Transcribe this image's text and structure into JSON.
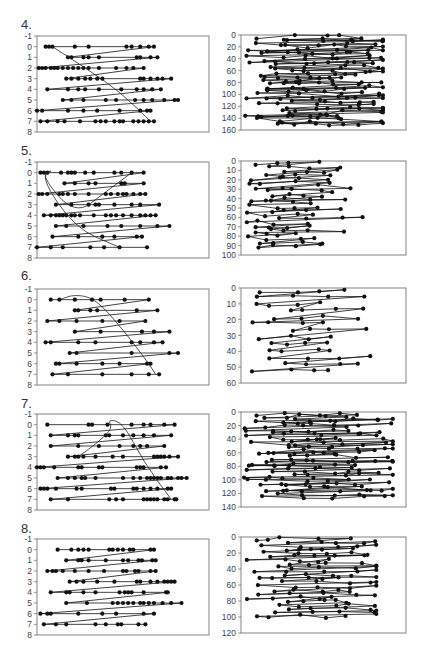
{
  "figure": {
    "width": 428,
    "height": 654,
    "row_labels": [
      "4.",
      "5.",
      "6.",
      "7.",
      "8."
    ]
  },
  "colors": {
    "marker": "#111111",
    "line": "#111111",
    "frame": "#777777",
    "tick_text": "#444444"
  },
  "chart_data": [
    {
      "id": "4-left",
      "row": "4.",
      "type": "line",
      "ylim": [
        -1,
        8
      ],
      "y_inverted": true,
      "yticks": [
        -1,
        0,
        1,
        2,
        3,
        4,
        5,
        6,
        7,
        8
      ],
      "xlabel": "",
      "ylabel": "",
      "grid": false,
      "rows": [
        {
          "y": 0,
          "x": [
            0.05,
            0.07,
            0.09,
            0.22,
            0.3,
            0.52,
            0.55,
            0.6,
            0.65,
            0.68
          ]
        },
        {
          "y": 1,
          "x": [
            0.18,
            0.2,
            0.27,
            0.3,
            0.36,
            0.58,
            0.6,
            0.66,
            0.7
          ]
        },
        {
          "y": 2,
          "x": [
            0.01,
            0.03,
            0.05,
            0.08,
            0.1,
            0.12,
            0.15,
            0.18,
            0.21,
            0.24,
            0.27,
            0.3,
            0.36,
            0.46,
            0.52,
            0.56,
            0.62
          ]
        },
        {
          "y": 3,
          "x": [
            0.17,
            0.2,
            0.24,
            0.28,
            0.31,
            0.35,
            0.38,
            0.6,
            0.62,
            0.66,
            0.7,
            0.73,
            0.78
          ]
        },
        {
          "y": 4,
          "x": [
            0.06,
            0.18,
            0.24,
            0.28,
            0.36,
            0.49,
            0.58,
            0.62,
            0.67,
            0.72
          ]
        },
        {
          "y": 5,
          "x": [
            0.15,
            0.2,
            0.27,
            0.4,
            0.46,
            0.57,
            0.62,
            0.67,
            0.74,
            0.8,
            0.82
          ]
        },
        {
          "y": 6,
          "x": [
            0.0,
            0.03,
            0.18,
            0.27,
            0.35,
            0.48,
            0.6,
            0.64,
            0.66
          ]
        },
        {
          "y": 7,
          "x": [
            0.02,
            0.06,
            0.12,
            0.16,
            0.25,
            0.34,
            0.37,
            0.4,
            0.45,
            0.48,
            0.5,
            0.56,
            0.59,
            0.62,
            0.65,
            0.68
          ]
        }
      ],
      "curve": [
        [
          0.09,
          0
        ],
        [
          0.3,
          2.2
        ],
        [
          0.48,
          4.2
        ],
        [
          0.66,
          7
        ]
      ]
    },
    {
      "id": "4-right",
      "row": "4.",
      "type": "line",
      "ylim": [
        0,
        160
      ],
      "y_inverted": true,
      "yticks": [
        0,
        20,
        40,
        60,
        80,
        100,
        120,
        140,
        160
      ],
      "xlabel": "",
      "ylabel": "",
      "grid": false,
      "points_per_row": 5,
      "n_rows": 36,
      "x_range": [
        0.02,
        0.86
      ],
      "y_range": [
        1,
        150
      ],
      "seed": 41
    },
    {
      "id": "5-left",
      "row": "5.",
      "type": "line",
      "ylim": [
        -1,
        8
      ],
      "y_inverted": true,
      "yticks": [
        -1,
        0,
        1,
        2,
        3,
        4,
        5,
        6,
        7,
        8
      ],
      "xlabel": "",
      "ylabel": "",
      "grid": false,
      "rows": [
        {
          "y": 0,
          "x": [
            0.02,
            0.04,
            0.06,
            0.14,
            0.18,
            0.2,
            0.22,
            0.28,
            0.33,
            0.45,
            0.49,
            0.55,
            0.62
          ]
        },
        {
          "y": 1,
          "x": [
            0.16,
            0.22,
            0.3,
            0.34,
            0.49,
            0.51,
            0.62
          ]
        },
        {
          "y": 2,
          "x": [
            0.01,
            0.03,
            0.06,
            0.13,
            0.15,
            0.18,
            0.22,
            0.3,
            0.4,
            0.43,
            0.47,
            0.5,
            0.52,
            0.56,
            0.6,
            0.63
          ]
        },
        {
          "y": 3,
          "x": [
            0.11,
            0.2,
            0.3,
            0.34,
            0.36,
            0.45,
            0.55,
            0.6,
            0.71
          ]
        },
        {
          "y": 4,
          "x": [
            0.04,
            0.08,
            0.11,
            0.13,
            0.15,
            0.17,
            0.2,
            0.22,
            0.25,
            0.33,
            0.4,
            0.43,
            0.46,
            0.5,
            0.55,
            0.6,
            0.63,
            0.66,
            0.69
          ]
        },
        {
          "y": 5,
          "x": [
            0.11,
            0.17,
            0.27,
            0.41,
            0.49,
            0.6,
            0.7,
            0.77
          ]
        },
        {
          "y": 6,
          "x": [
            0.09,
            0.24,
            0.38,
            0.45,
            0.58,
            0.61
          ]
        },
        {
          "y": 7,
          "x": [
            0.0,
            0.08,
            0.15,
            0.31,
            0.39,
            0.48,
            0.64
          ]
        }
      ],
      "curve": [
        [
          0.55,
          0
        ],
        [
          0.4,
          1.8
        ],
        [
          0.22,
          4
        ],
        [
          0.02,
          0.2
        ],
        [
          0.1,
          -0.3
        ],
        [
          0.02,
          0.4
        ],
        [
          0.22,
          5.2
        ],
        [
          0.48,
          7
        ]
      ]
    },
    {
      "id": "5-right",
      "row": "5.",
      "type": "line",
      "ylim": [
        0,
        100
      ],
      "y_inverted": true,
      "yticks": [
        0,
        10,
        20,
        30,
        40,
        50,
        60,
        70,
        80,
        90,
        100
      ],
      "xlabel": "",
      "ylabel": "",
      "grid": false,
      "points_per_row": 4,
      "n_rows": 22,
      "x_range": [
        0.02,
        0.78
      ],
      "y_range": [
        1,
        90
      ],
      "seed": 52
    },
    {
      "id": "6-left",
      "row": "6.",
      "type": "line",
      "ylim": [
        -1,
        8
      ],
      "y_inverted": true,
      "yticks": [
        -1,
        0,
        1,
        2,
        3,
        4,
        5,
        6,
        7,
        8
      ],
      "xlabel": "",
      "ylabel": "",
      "grid": false,
      "rows": [
        {
          "y": 0,
          "x": [
            0.08,
            0.13,
            0.22,
            0.32,
            0.37,
            0.51,
            0.65
          ]
        },
        {
          "y": 1,
          "x": [
            0.22,
            0.24,
            0.31,
            0.35,
            0.58,
            0.7
          ]
        },
        {
          "y": 2,
          "x": [
            0.06,
            0.13,
            0.23,
            0.38,
            0.48,
            0.63
          ]
        },
        {
          "y": 3,
          "x": [
            0.22,
            0.37,
            0.61,
            0.68,
            0.77
          ]
        },
        {
          "y": 4,
          "x": [
            0.05,
            0.08,
            0.24,
            0.34,
            0.55,
            0.6,
            0.68,
            0.73
          ]
        },
        {
          "y": 5,
          "x": [
            0.19,
            0.23,
            0.55,
            0.77,
            0.82
          ]
        },
        {
          "y": 6,
          "x": [
            0.11,
            0.13,
            0.23,
            0.38,
            0.48,
            0.64,
            0.66
          ]
        },
        {
          "y": 7,
          "x": [
            0.09,
            0.18,
            0.38,
            0.55,
            0.65,
            0.71
          ]
        }
      ],
      "curve": [
        [
          0.13,
          0
        ],
        [
          0.22,
          -0.5
        ],
        [
          0.34,
          -0.1
        ],
        [
          0.5,
          2.8
        ],
        [
          0.65,
          6
        ],
        [
          0.69,
          7
        ]
      ]
    },
    {
      "id": "6-right",
      "row": "6.",
      "type": "line",
      "ylim": [
        0,
        60
      ],
      "y_inverted": true,
      "yticks": [
        0,
        10,
        20,
        30,
        40,
        50,
        60
      ],
      "xlabel": "",
      "ylabel": "",
      "grid": false,
      "points_per_row": 4,
      "n_rows": 13,
      "x_range": [
        0.04,
        0.84
      ],
      "y_range": [
        1,
        52
      ],
      "seed": 63
    },
    {
      "id": "7-left",
      "row": "7.",
      "type": "line",
      "ylim": [
        -1,
        8
      ],
      "y_inverted": true,
      "yticks": [
        -1,
        0,
        1,
        2,
        3,
        4,
        5,
        6,
        7,
        8
      ],
      "xlabel": "",
      "ylabel": "",
      "grid": false,
      "rows": [
        {
          "y": 0,
          "x": [
            0.06,
            0.3,
            0.32,
            0.41,
            0.55,
            0.62,
            0.66,
            0.74,
            0.8
          ]
        },
        {
          "y": 1,
          "x": [
            0.08,
            0.18,
            0.22,
            0.24,
            0.4,
            0.42,
            0.5,
            0.56,
            0.62,
            0.68,
            0.78
          ]
        },
        {
          "y": 2,
          "x": [
            0.08,
            0.24,
            0.36,
            0.48,
            0.56,
            0.6,
            0.64,
            0.74
          ]
        },
        {
          "y": 3,
          "x": [
            0.18,
            0.22,
            0.24,
            0.27,
            0.34,
            0.44,
            0.5,
            0.68,
            0.7,
            0.72,
            0.74,
            0.77,
            0.82
          ]
        },
        {
          "y": 4,
          "x": [
            0.0,
            0.02,
            0.04,
            0.1,
            0.24,
            0.26,
            0.36,
            0.38,
            0.58,
            0.6,
            0.62,
            0.72,
            0.75
          ]
        },
        {
          "y": 5,
          "x": [
            0.12,
            0.18,
            0.22,
            0.26,
            0.28,
            0.34,
            0.5,
            0.56,
            0.6,
            0.64,
            0.66,
            0.68,
            0.7,
            0.72,
            0.76,
            0.78,
            0.82,
            0.84,
            0.87
          ]
        },
        {
          "y": 6,
          "x": [
            0.02,
            0.04,
            0.06,
            0.11,
            0.23,
            0.26,
            0.43,
            0.45,
            0.56,
            0.58,
            0.62,
            0.66,
            0.7,
            0.76,
            0.78
          ]
        },
        {
          "y": 7,
          "x": [
            0.08,
            0.18,
            0.42,
            0.46,
            0.5,
            0.62,
            0.64,
            0.66,
            0.68,
            0.7,
            0.74,
            0.76,
            0.8,
            0.81
          ]
        }
      ],
      "curve": [
        [
          0.24,
          3
        ],
        [
          0.36,
          1.6
        ],
        [
          0.44,
          0.3
        ],
        [
          0.41,
          -0.5
        ],
        [
          0.5,
          -0.2
        ],
        [
          0.62,
          3.5
        ],
        [
          0.78,
          7
        ]
      ]
    },
    {
      "id": "7-right",
      "row": "7.",
      "type": "line",
      "ylim": [
        0,
        140
      ],
      "y_inverted": true,
      "yticks": [
        0,
        20,
        40,
        60,
        80,
        100,
        120,
        140
      ],
      "xlabel": "",
      "ylabel": "",
      "grid": false,
      "points_per_row": 5,
      "n_rows": 32,
      "x_range": [
        0.01,
        0.92
      ],
      "y_range": [
        1,
        124
      ],
      "seed": 74
    },
    {
      "id": "8-left",
      "row": "8.",
      "type": "line",
      "ylim": [
        -1,
        8
      ],
      "y_inverted": true,
      "yticks": [
        -1,
        0,
        1,
        2,
        3,
        4,
        5,
        6,
        7,
        8
      ],
      "xlabel": "",
      "ylabel": "",
      "grid": false,
      "rows": [
        {
          "y": 0,
          "x": [
            0.12,
            0.2,
            0.24,
            0.27,
            0.3,
            0.42,
            0.44,
            0.47,
            0.5,
            0.54,
            0.56,
            0.66,
            0.68
          ]
        },
        {
          "y": 1,
          "x": [
            0.17,
            0.24,
            0.26,
            0.3,
            0.4,
            0.5,
            0.53,
            0.59,
            0.61,
            0.67,
            0.69
          ]
        },
        {
          "y": 2,
          "x": [
            0.06,
            0.09,
            0.11,
            0.15,
            0.22,
            0.3,
            0.39,
            0.5,
            0.52,
            0.57,
            0.59,
            0.66,
            0.69
          ]
        },
        {
          "y": 3,
          "x": [
            0.19,
            0.23,
            0.27,
            0.35,
            0.45,
            0.58,
            0.6,
            0.66,
            0.7,
            0.74,
            0.76,
            0.78,
            0.8
          ]
        },
        {
          "y": 4,
          "x": [
            0.08,
            0.17,
            0.19,
            0.27,
            0.34,
            0.48,
            0.51,
            0.53,
            0.55,
            0.62,
            0.75,
            0.76
          ]
        },
        {
          "y": 5,
          "x": [
            0.17,
            0.29,
            0.44,
            0.47,
            0.5,
            0.53,
            0.56,
            0.6,
            0.62,
            0.65,
            0.68,
            0.73,
            0.78,
            0.84
          ]
        },
        {
          "y": 6,
          "x": [
            0.02,
            0.06,
            0.08,
            0.24,
            0.38,
            0.46,
            0.62,
            0.68
          ]
        },
        {
          "y": 7,
          "x": [
            0.04,
            0.11,
            0.17,
            0.34,
            0.4,
            0.47,
            0.49,
            0.59,
            0.63
          ]
        }
      ],
      "curve": []
    },
    {
      "id": "8-right",
      "row": "8.",
      "type": "line",
      "ylim": [
        0,
        120
      ],
      "y_inverted": true,
      "yticks": [
        0,
        20,
        40,
        60,
        80,
        100,
        120
      ],
      "xlabel": "",
      "ylabel": "",
      "grid": false,
      "points_per_row": 5,
      "n_rows": 22,
      "x_range": [
        0.02,
        0.82
      ],
      "y_range": [
        1,
        98
      ],
      "seed": 85
    }
  ]
}
